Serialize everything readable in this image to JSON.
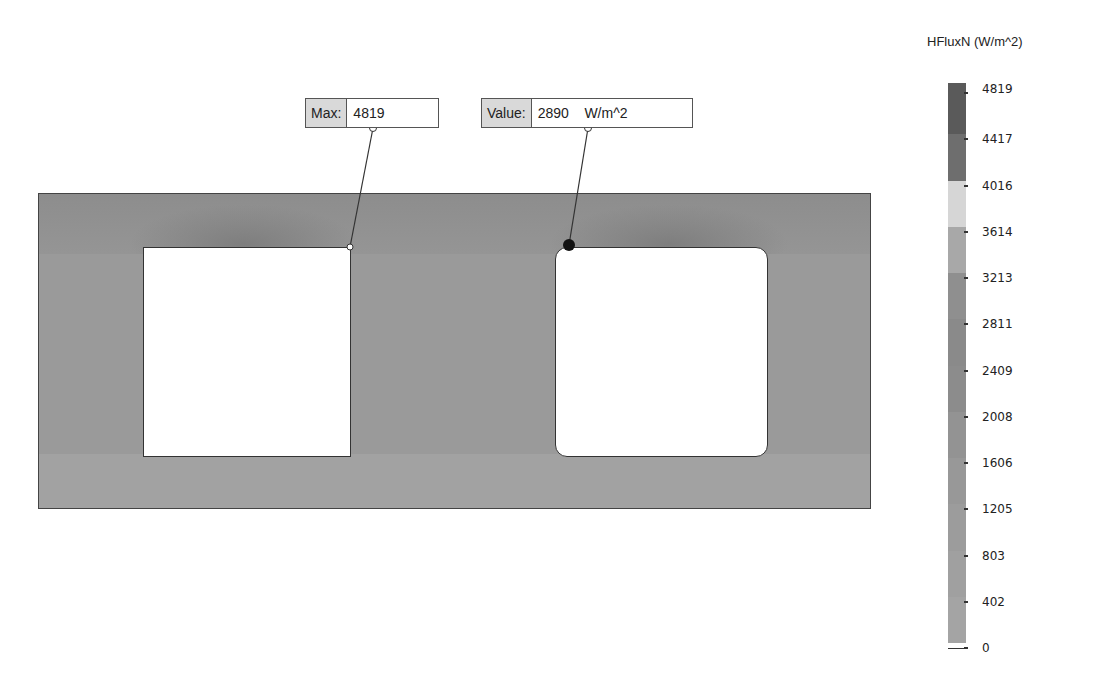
{
  "legend": {
    "title": "HFluxN (W/m^2)",
    "ticks": [
      "4819",
      "4417",
      "4016",
      "3614",
      "3213",
      "2811",
      "2409",
      "2008",
      "1606",
      "1205",
      "803",
      "402",
      "0"
    ],
    "band_colors": [
      "#5a5a5a",
      "#6e6e6e",
      "#d6d6d6",
      "#a8a8a8",
      "#8f8f8f",
      "#8a8a8a",
      "#8c8c8c",
      "#939393",
      "#989898",
      "#9c9c9c",
      "#a0a0a0",
      "#a4a4a4"
    ]
  },
  "callouts": {
    "max": {
      "label": "Max:",
      "value": "4819"
    },
    "probe": {
      "label": "Value:",
      "value": "2890    W/m^2"
    }
  },
  "chart_data": {
    "type": "heatmap",
    "title": "HFluxN (W/m^2)",
    "colorbar": {
      "label": "HFluxN (W/m^2)",
      "min": 0,
      "max": 4819,
      "ticks": [
        4819,
        4417,
        4016,
        3614,
        3213,
        2811,
        2409,
        2008,
        1606,
        1205,
        803,
        402,
        0
      ]
    },
    "annotations": [
      {
        "type": "max",
        "label": "Max:",
        "value": 4819,
        "location": "top-right corner of left opening"
      },
      {
        "type": "probe",
        "label": "Value:",
        "value": 2890,
        "unit": "W/m^2",
        "location": "top-left corner of right opening"
      }
    ]
  }
}
